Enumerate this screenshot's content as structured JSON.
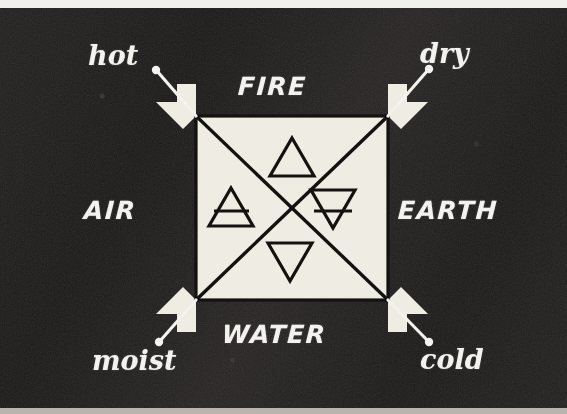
{
  "figure": {
    "title_alt": "Classical four elements diagram with qualities",
    "background_color": "#1f1d1c",
    "ink_color": "#f4f2ee",
    "panel_color": "#efece4",
    "line_color": "#14120f",
    "top_strip_color": "#ffffff",
    "bottom_strip_color": "#b9b5ae"
  },
  "elements": [
    {
      "key": "fire",
      "label": "FIRE",
      "symbol_name": "triangle-up",
      "position": "top"
    },
    {
      "key": "air",
      "label": "AIR",
      "symbol_name": "triangle-up-barred",
      "position": "left"
    },
    {
      "key": "earth",
      "label": "EARTH",
      "symbol_name": "triangle-down-barred",
      "position": "right"
    },
    {
      "key": "water",
      "label": "WATER",
      "symbol_name": "triangle-down",
      "position": "bottom"
    }
  ],
  "qualities": [
    {
      "key": "hot",
      "label": "hot",
      "corner": "top-left"
    },
    {
      "key": "dry",
      "label": "dry",
      "corner": "top-right"
    },
    {
      "key": "moist",
      "label": "moist",
      "corner": "bottom-left"
    },
    {
      "key": "cold",
      "label": "cold",
      "corner": "bottom-right"
    }
  ],
  "diagram": {
    "square": {
      "x": 196,
      "y": 116,
      "width": 192,
      "height": 184
    },
    "diagonals": [
      "top-left-to-bottom-right",
      "top-right-to-bottom-left"
    ],
    "arrows": [
      {
        "name": "arrow-up-left",
        "at": "top-left"
      },
      {
        "name": "arrow-up-right",
        "at": "top-right"
      },
      {
        "name": "arrow-down-left",
        "at": "bottom-left"
      },
      {
        "name": "arrow-down-right",
        "at": "bottom-right"
      }
    ],
    "leaders": [
      {
        "name": "leader-hot",
        "from": "top-left-corner",
        "to": "hot"
      },
      {
        "name": "leader-dry",
        "from": "top-right-corner",
        "to": "dry"
      },
      {
        "name": "leader-moist",
        "from": "bottom-left-corner",
        "to": "moist"
      },
      {
        "name": "leader-cold",
        "from": "bottom-right-corner",
        "to": "cold"
      }
    ]
  }
}
